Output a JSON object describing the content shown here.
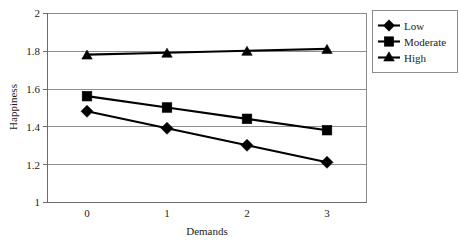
{
  "chart_data": {
    "type": "line",
    "title": "",
    "xlabel": "Demands",
    "ylabel": "Happiness",
    "x": [
      0,
      1,
      2,
      3
    ],
    "categories": [
      "0",
      "1",
      "2",
      "3"
    ],
    "xticklabels": [
      "0",
      "1",
      "2",
      "3"
    ],
    "yticklabels": [
      "1",
      "1.2",
      "1.4",
      "1.6",
      "1.8",
      "2"
    ],
    "yticks": [
      1,
      1.2,
      1.4,
      1.6,
      1.8,
      2
    ],
    "ylim": [
      1,
      2
    ],
    "xlim": [
      -0.35,
      3.35
    ],
    "grid": "horizontal",
    "legend_position": "right-outside",
    "series": [
      {
        "name": "Low",
        "marker": "diamond",
        "color": "#000000",
        "values": [
          1.48,
          1.39,
          1.3,
          1.21
        ]
      },
      {
        "name": "Moderate",
        "marker": "square",
        "color": "#000000",
        "values": [
          1.56,
          1.5,
          1.44,
          1.38
        ]
      },
      {
        "name": "High",
        "marker": "triangle",
        "color": "#000000",
        "values": [
          1.78,
          1.79,
          1.8,
          1.81
        ]
      }
    ]
  },
  "legend": {
    "items": [
      {
        "label": "Low",
        "marker": "diamond-marker-icon"
      },
      {
        "label": "Moderate",
        "marker": "square-marker-icon"
      },
      {
        "label": "High",
        "marker": "triangle-marker-icon"
      }
    ]
  },
  "axes": {
    "y_title": "Happiness",
    "x_title": "Demands",
    "y_tick_0": "1",
    "y_tick_1": "1.2",
    "y_tick_2": "1.4",
    "y_tick_3": "1.6",
    "y_tick_4": "1.8",
    "y_tick_5": "2",
    "x_tick_0": "0",
    "x_tick_1": "1",
    "x_tick_2": "2",
    "x_tick_3": "3"
  },
  "colors": {
    "background": "#ffffff",
    "ink": "#000000",
    "grid": "#8d8d8d",
    "text": "#1c1c1c"
  }
}
